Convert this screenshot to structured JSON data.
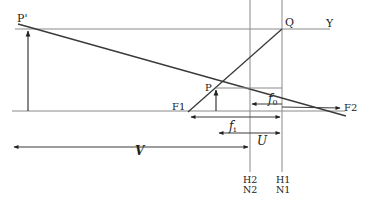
{
  "diagram": {
    "type": "optics-lens-principal-planes",
    "labels": {
      "p_prime": "P'",
      "q": "Q",
      "y": "Y",
      "p": "P",
      "f1": "F1",
      "f2": "F2",
      "f0_base": "f",
      "f0_sub": "0",
      "fi_base": "f",
      "fi_sub": "i",
      "u": "U",
      "v": "V",
      "h2": "H2",
      "n2": "N2",
      "h1": "H1",
      "n1": "N1"
    },
    "colors": {
      "line": "#3a3a3a",
      "thin_line": "#8a8a8a",
      "text": "#222222"
    }
  }
}
